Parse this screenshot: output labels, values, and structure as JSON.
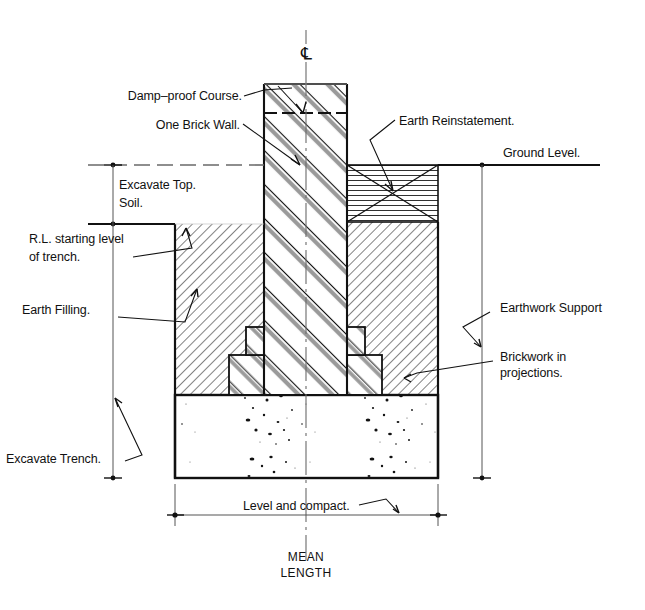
{
  "drawing": {
    "title": "Strip foundation / trench excavation section",
    "centerline_symbol": "℄",
    "colors": {
      "line": "#111111",
      "hatch_gray": "#9a9a9a",
      "thin": "#555555",
      "background": "#ffffff"
    }
  },
  "labels": {
    "damp_proof_course": "Damp–proof Course.",
    "one_brick_wall": "One Brick Wall.",
    "earth_reinstatement": "Earth Reinstatement.",
    "ground_level": "Ground Level.",
    "excavate_top_soil_line1": "Excavate Top.",
    "excavate_top_soil_line2": "Soil.",
    "rl_starting_level_line1": "R.L. starting level",
    "rl_starting_level_line2": "of trench.",
    "earth_filling": "Earth Filling.",
    "earthwork_support": "Earthwork Support",
    "brickwork_in_projections_line1": "Brickwork in",
    "brickwork_in_projections_line2": "projections.",
    "excavate_trench": "Excavate Trench.",
    "level_and_compact": "Level and compact.",
    "mean_line1": "MEAN",
    "mean_line2": "LENGTH"
  },
  "geometry": {
    "wall": {
      "left": 264,
      "right": 347,
      "top": 84,
      "dpc_y": 113
    },
    "ground_level_y": 165,
    "rl_level_y": 224,
    "trench": {
      "left": 175,
      "right": 438
    },
    "reinstatement": {
      "left": 347,
      "right": 438,
      "top": 165,
      "bottom": 222
    },
    "concrete": {
      "top": 395,
      "bottom": 478
    },
    "dimension_line_y": 515,
    "left_dim_x": 113,
    "right_dim_x": 482,
    "centerline_x": 306
  }
}
